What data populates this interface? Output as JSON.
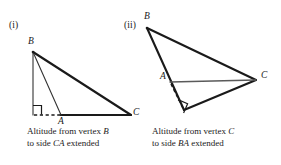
{
  "page": {
    "background_color": "#ffffff",
    "ink_color": "#1a1a1a",
    "thin_line_color": "#555555",
    "width": 281,
    "height": 165
  },
  "figures": [
    {
      "id": "figure-i",
      "number_label": "(i)",
      "vertices": [
        {
          "name": "B",
          "label": "B",
          "x": 33,
          "y": 52
        },
        {
          "name": "A",
          "label": "A",
          "x": 61,
          "y": 115
        },
        {
          "name": "C",
          "label": "C",
          "x": 131,
          "y": 115
        },
        {
          "name": "foot",
          "label": "",
          "x": 33,
          "y": 115
        }
      ],
      "right_angle_at": "foot",
      "altitude": {
        "from": "B",
        "to_foot": "foot",
        "style": "solid"
      },
      "extension": {
        "from": "foot",
        "to": "A",
        "style": "dashed"
      },
      "caption": {
        "line1_prefix": "Altitude from vertex ",
        "line1_italic": "B",
        "line2_prefix": "to side ",
        "line2_italic": "CA",
        "line2_suffix": " extended"
      }
    },
    {
      "id": "figure-ii",
      "number_label": "(ii)",
      "vertices": [
        {
          "name": "B",
          "label": "B",
          "x": 147,
          "y": 28
        },
        {
          "name": "A",
          "label": "A",
          "x": 170,
          "y": 82
        },
        {
          "name": "C",
          "label": "C",
          "x": 256,
          "y": 80
        },
        {
          "name": "foot",
          "label": "",
          "x": 184,
          "y": 110
        }
      ],
      "right_angle_at": "foot",
      "altitude": {
        "from": "C",
        "to_foot": "foot",
        "style": "solid"
      },
      "extension": {
        "from": "A",
        "to": "foot",
        "style": "dashed"
      },
      "caption": {
        "line1_prefix": "Altitude from vertex ",
        "line1_italic": "C",
        "line2_prefix": "to side ",
        "line2_italic": "BA",
        "line2_suffix": " extended"
      }
    }
  ]
}
